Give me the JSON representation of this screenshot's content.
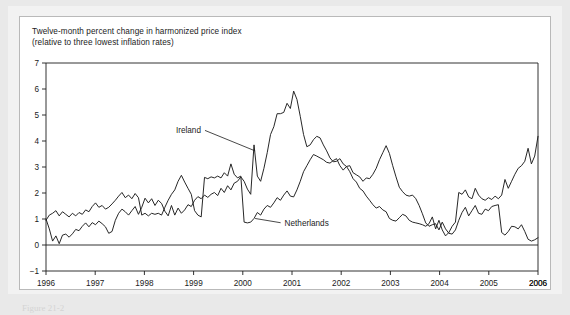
{
  "figure": {
    "title_line1": "Twelve-month percent change in harmonized price index",
    "title_line2": "(relative to three lowest inflation rates)",
    "caption": "Figure 21-2"
  },
  "chart_data": {
    "type": "line",
    "title": "Twelve-month percent change in harmonized price index (relative to three lowest inflation rates)",
    "xlabel": "",
    "ylabel": "",
    "xlim": [
      1996.0,
      2006.0
    ],
    "ylim": [
      -1,
      7
    ],
    "yticks": [
      -1,
      0,
      1,
      2,
      3,
      4,
      5,
      6,
      7
    ],
    "ytick_labels": [
      "−1",
      "0",
      "1",
      "2",
      "3",
      "4",
      "5",
      "6",
      "7"
    ],
    "xticks": [
      1996,
      1997,
      1998,
      1999,
      2000,
      2001,
      2002,
      2003,
      2004,
      2005,
      2006
    ],
    "xtick_labels": [
      "1996",
      "1997",
      "1998",
      "1999",
      "2000",
      "2001",
      "2002",
      "2003",
      "2004",
      "2005",
      "2006"
    ],
    "x_end_label": "2006",
    "grid": false,
    "legend": "inline-annotations",
    "annotations": [
      {
        "name": "Ireland",
        "label_x": 1999.15,
        "label_y": 4.33,
        "leader_to_x": 2000.25,
        "leader_to_y": 3.62
      },
      {
        "name": "Netherlands",
        "label_x": 2000.85,
        "label_y": 0.78,
        "leader_to_x": 2000.25,
        "leader_to_y": 1.02
      }
    ],
    "x_monthly_start": 1996.0,
    "x_monthly_step": 0.08333,
    "series": [
      {
        "name": "Ireland",
        "values": [
          1.0,
          0.62,
          0.15,
          0.35,
          0.05,
          0.38,
          0.42,
          0.3,
          0.43,
          0.6,
          0.55,
          0.72,
          0.85,
          0.7,
          0.86,
          0.78,
          0.92,
          0.82,
          0.7,
          0.45,
          0.52,
          0.95,
          1.22,
          1.38,
          1.28,
          1.15,
          1.32,
          1.48,
          1.18,
          1.45,
          1.8,
          1.62,
          1.78,
          1.52,
          1.72,
          1.6,
          1.3,
          1.12,
          1.52,
          1.15,
          1.42,
          1.22,
          1.35,
          1.55,
          1.48,
          1.72,
          1.86,
          1.78,
          1.92,
          1.83,
          1.95,
          2.02,
          1.9,
          2.18,
          2.02,
          2.28,
          2.12,
          2.38,
          2.45,
          2.62,
          2.45,
          2.15,
          1.95,
          3.85,
          2.65,
          2.45,
          2.95,
          3.55,
          4.25,
          4.55,
          5.05,
          5.05,
          5.1,
          5.45,
          5.25,
          5.92,
          5.6,
          4.95,
          4.25,
          3.78,
          3.85,
          4.05,
          4.18,
          4.12,
          3.85,
          3.62,
          3.35,
          3.2,
          3.22,
          3.32,
          3.12,
          3.02,
          3.05,
          2.78,
          2.7,
          2.62,
          2.45,
          2.58,
          2.55,
          2.72,
          2.95,
          3.28,
          3.55,
          3.82,
          3.52,
          3.05,
          2.62,
          2.22,
          2.05,
          1.92,
          1.88,
          1.92,
          1.78,
          1.52,
          1.2,
          0.85,
          0.72,
          0.78,
          0.82,
          0.58,
          0.88,
          0.62,
          0.45,
          0.42,
          0.58,
          0.95,
          1.25,
          1.45,
          1.12,
          1.32,
          1.52,
          1.22,
          1.18,
          1.38,
          1.32,
          1.48,
          1.52,
          1.55,
          0.48,
          0.38,
          0.52,
          0.72,
          0.7,
          0.62,
          0.78,
          0.52,
          0.22,
          0.15,
          0.2,
          0.28
        ]
      },
      {
        "name": "Netherlands",
        "values": [
          0.95,
          1.15,
          1.22,
          1.32,
          1.12,
          1.28,
          1.18,
          1.08,
          1.22,
          1.12,
          1.25,
          1.18,
          1.35,
          1.28,
          1.48,
          1.62,
          1.45,
          1.52,
          1.38,
          1.45,
          1.58,
          1.72,
          1.88,
          2.02,
          1.82,
          1.92,
          1.78,
          1.98,
          1.82,
          1.15,
          1.22,
          1.12,
          1.22,
          1.18,
          1.22,
          1.15,
          1.45,
          1.72,
          1.95,
          2.12,
          2.45,
          2.68,
          2.42,
          2.18,
          1.95,
          1.32,
          1.15,
          1.08,
          2.6,
          2.55,
          2.62,
          2.58,
          2.65,
          2.58,
          2.78,
          2.65,
          3.12,
          2.72,
          2.58,
          2.65,
          0.88,
          0.85,
          0.88,
          1.02,
          1.25,
          1.15,
          1.38,
          1.52,
          1.45,
          1.62,
          1.82,
          1.72,
          1.92,
          2.08,
          1.88,
          1.85,
          2.12,
          2.45,
          2.82,
          3.05,
          3.28,
          3.48,
          3.42,
          3.35,
          3.28,
          3.18,
          3.15,
          3.25,
          3.32,
          3.05,
          2.88,
          3.02,
          2.82,
          2.55,
          2.42,
          2.18,
          2.08,
          1.88,
          1.72,
          1.55,
          1.42,
          1.48,
          1.35,
          1.28,
          1.02,
          0.95,
          0.92,
          1.05,
          1.18,
          1.12,
          0.95,
          0.88,
          0.85,
          0.82,
          0.78,
          0.72,
          0.82,
          1.08,
          0.62,
          0.95,
          0.58,
          0.35,
          0.48,
          0.72,
          0.88,
          2.02,
          1.95,
          2.12,
          1.85,
          1.78,
          2.18,
          1.92,
          1.78,
          1.72,
          1.82,
          1.75,
          1.88,
          1.78,
          1.92,
          2.52,
          2.18,
          2.45,
          2.72,
          2.95,
          3.05,
          3.22,
          3.72,
          3.12,
          3.42,
          4.18
        ]
      }
    ]
  }
}
